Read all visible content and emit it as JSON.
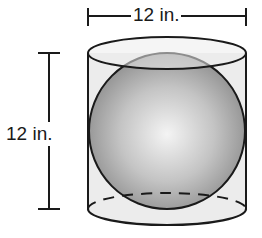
{
  "figure": {
    "shapes": [
      "cylinder",
      "sphere"
    ],
    "colors": {
      "outline": "#1a1a1a",
      "cylinder_fill": "#ececec",
      "sphere_highlight": "#f4f4f4",
      "sphere_shadow": "#8e8e8e",
      "background": "#ffffff"
    }
  },
  "dimensions": {
    "width": {
      "value": 12,
      "unit": "in.",
      "label": "12 in."
    },
    "height": {
      "value": 12,
      "unit": "in.",
      "label": "12 in."
    }
  }
}
